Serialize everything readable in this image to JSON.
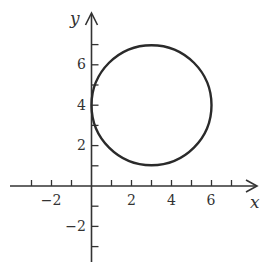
{
  "chart_data": {
    "type": "line",
    "title": "",
    "xlabel": "x",
    "ylabel": "y",
    "xlim": [
      -3,
      7.8
    ],
    "ylim": [
      -3.8,
      8.6
    ],
    "grid": false,
    "legend": null,
    "x_ticks": [
      -3,
      -2,
      -1,
      0,
      1,
      2,
      3,
      4,
      5,
      6,
      7
    ],
    "y_ticks": [
      -3,
      -2,
      -1,
      0,
      1,
      2,
      3,
      4,
      5,
      6,
      7
    ],
    "x_tick_labels": [
      "-2",
      "2",
      "4",
      "6"
    ],
    "y_tick_labels": [
      "-2",
      "2",
      "4",
      "6"
    ],
    "series": [
      {
        "name": "circle",
        "shape": "circle",
        "center": [
          3,
          4
        ],
        "radius": 3,
        "equation": "(x - 3)^2 + (y - 4)^2 = 9"
      }
    ]
  },
  "labels": {
    "x_axis": "x",
    "y_axis": "y",
    "x_ticks": [
      {
        "value": -2,
        "text": "−2"
      },
      {
        "value": 2,
        "text": "2"
      },
      {
        "value": 4,
        "text": "4"
      },
      {
        "value": 6,
        "text": "6"
      }
    ],
    "y_ticks": [
      {
        "value": 2,
        "text": "2"
      },
      {
        "value": 4,
        "text": "4"
      },
      {
        "value": 6,
        "text": "6"
      },
      {
        "value": -2,
        "text": "−2"
      }
    ]
  }
}
